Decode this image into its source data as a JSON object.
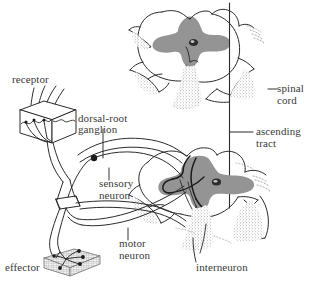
{
  "figure": {
    "width": 321,
    "height": 285,
    "background_color": "#ffffff"
  },
  "colors": {
    "ink": "#2b2b2b",
    "text": "#3a3a3a",
    "gray_matter": "#949494",
    "stipple": "#6e6e6e",
    "background": "#ffffff"
  },
  "labels": {
    "receptor": "receptor",
    "dorsal_root_ganglion_line1": "dorsal-root",
    "dorsal_root_ganglion_line2": "ganglion",
    "sensory_neuron_line1": "sensory",
    "sensory_neuron_line2": "neuron",
    "motor_neuron_line1": "motor",
    "motor_neuron_line2": "neuron",
    "effector": "effector",
    "interneuron": "interneuron",
    "spinal_cord_line1": "spinal",
    "spinal_cord_line2": "cord",
    "ascending_tract_line1": "ascending",
    "ascending_tract_line2": "tract"
  },
  "parts": {
    "upper_cord": "upper-spinal-cord-cross-section",
    "lower_cord": "lower-spinal-cord-cross-section",
    "receptor_block": "skin-receptor-block",
    "effector_block": "muscle-effector-block",
    "ganglion_dot": "dorsal-root-ganglion-cell-body",
    "ascending_tract_line": "ascending-tract-vertical-line"
  }
}
